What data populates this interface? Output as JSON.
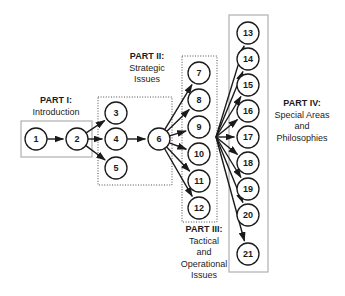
{
  "diagram": {
    "colors": {
      "node_stroke": "#1a1a1a",
      "node_fill": "#ffffff",
      "arrow": "#1a1a1a",
      "solid_box_border": "#b0b0b0",
      "dotted_box_border": "#4d4d4d",
      "text": "#1c1c1c",
      "background": "#ffffff"
    },
    "groups": [
      {
        "id": "part1",
        "header": "PART I:",
        "lines": [
          "Introduction"
        ],
        "border_style": "solid",
        "box": {
          "x": 21,
          "y": 121,
          "w": 71,
          "h": 36
        },
        "nodes": [
          "1",
          "2"
        ]
      },
      {
        "id": "part2",
        "header": "PART II:",
        "lines": [
          "Strategic",
          "Issues"
        ],
        "border_style": "dotted",
        "box": {
          "x": 98,
          "y": 97,
          "w": 74,
          "h": 88
        },
        "nodes": [
          "3",
          "4",
          "5",
          "6"
        ]
      },
      {
        "id": "part3",
        "header": "PART III:",
        "lines": [
          "Tactical",
          "and",
          "Operational",
          "Issues"
        ],
        "border_style": "dotted",
        "box": {
          "x": 182,
          "y": 56,
          "w": 35,
          "h": 166
        },
        "nodes": [
          "7",
          "8",
          "9",
          "10",
          "11",
          "12"
        ]
      },
      {
        "id": "part4",
        "header": "PART IV:",
        "lines": [
          "Special Areas",
          "and",
          "Philosophies"
        ],
        "border_style": "solid",
        "box": {
          "x": 229,
          "y": 15,
          "w": 39,
          "h": 257
        },
        "nodes": [
          "13",
          "14",
          "15",
          "16",
          "17",
          "18",
          "19",
          "20",
          "21"
        ]
      }
    ],
    "nodes": [
      {
        "id": "1",
        "label": "1",
        "cx": 36,
        "cy": 139,
        "r": 11
      },
      {
        "id": "2",
        "label": "2",
        "cx": 77,
        "cy": 139,
        "r": 11
      },
      {
        "id": "3",
        "label": "3",
        "cx": 116,
        "cy": 113,
        "r": 11
      },
      {
        "id": "4",
        "label": "4",
        "cx": 116,
        "cy": 139,
        "r": 11
      },
      {
        "id": "5",
        "label": "5",
        "cx": 116,
        "cy": 168,
        "r": 11
      },
      {
        "id": "6",
        "label": "6",
        "cx": 159,
        "cy": 139,
        "r": 11
      },
      {
        "id": "7",
        "label": "7",
        "cx": 199,
        "cy": 73,
        "r": 11
      },
      {
        "id": "8",
        "label": "8",
        "cx": 199,
        "cy": 100,
        "r": 11
      },
      {
        "id": "9",
        "label": "9",
        "cx": 199,
        "cy": 127,
        "r": 11
      },
      {
        "id": "10",
        "label": "10",
        "cx": 199,
        "cy": 154,
        "r": 11
      },
      {
        "id": "11",
        "label": "11",
        "cx": 199,
        "cy": 181,
        "r": 11
      },
      {
        "id": "12",
        "label": "12",
        "cx": 199,
        "cy": 208,
        "r": 11
      },
      {
        "id": "13",
        "label": "13",
        "cx": 248,
        "cy": 33,
        "r": 11
      },
      {
        "id": "14",
        "label": "14",
        "cx": 248,
        "cy": 59,
        "r": 11
      },
      {
        "id": "15",
        "label": "15",
        "cx": 248,
        "cy": 85,
        "r": 11
      },
      {
        "id": "16",
        "label": "16",
        "cx": 248,
        "cy": 111,
        "r": 11
      },
      {
        "id": "17",
        "label": "17",
        "cx": 248,
        "cy": 137,
        "r": 11
      },
      {
        "id": "18",
        "label": "18",
        "cx": 248,
        "cy": 163,
        "r": 11
      },
      {
        "id": "19",
        "label": "19",
        "cx": 248,
        "cy": 189,
        "r": 11
      },
      {
        "id": "20",
        "label": "20",
        "cx": 248,
        "cy": 215,
        "r": 11
      },
      {
        "id": "21",
        "label": "21",
        "cx": 248,
        "cy": 254,
        "r": 11
      }
    ],
    "edges": [
      {
        "from": "1",
        "to": "2"
      },
      {
        "from": "2",
        "to": "3"
      },
      {
        "from": "2",
        "to": "4"
      },
      {
        "from": "2",
        "to": "5"
      },
      {
        "from": "4",
        "to": "6"
      },
      {
        "from": "6",
        "to": "7"
      },
      {
        "from": "6",
        "to": "8"
      },
      {
        "from": "6",
        "to": "9"
      },
      {
        "from": "6",
        "to": "10"
      },
      {
        "from": "6",
        "to": "11"
      },
      {
        "from": "6",
        "to": "12"
      },
      {
        "from": "hub",
        "to": "13"
      },
      {
        "from": "hub",
        "to": "14"
      },
      {
        "from": "hub",
        "to": "15"
      },
      {
        "from": "hub",
        "to": "16"
      },
      {
        "from": "hub",
        "to": "17"
      },
      {
        "from": "hub",
        "to": "18"
      },
      {
        "from": "hub",
        "to": "19"
      },
      {
        "from": "hub",
        "to": "20"
      },
      {
        "from": "hub",
        "to": "21"
      }
    ],
    "hub": {
      "x": 216,
      "y": 137
    }
  }
}
